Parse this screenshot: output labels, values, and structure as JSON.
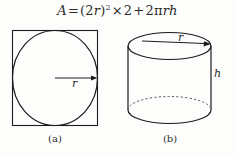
{
  "figure": {
    "formula": {
      "full_text": "A=(2r)²×2+2πrh",
      "lhs": "A",
      "equals": "=",
      "term1_open": "(2",
      "term1_var": "r",
      "term1_close": ")",
      "term1_exponent": "2",
      "times": "×",
      "factor": "2",
      "plus": "+",
      "term2_coefficient": "2π",
      "term2_var1": "r",
      "term2_var2": "h"
    },
    "panel_a": {
      "caption": "(a)",
      "shape_outer": "square",
      "shape_inner": "circle-inscribed",
      "radius_label": "r",
      "arrow": "radius-arrow-right"
    },
    "panel_b": {
      "caption": "(b)",
      "shape": "cylinder",
      "radius_label": "r",
      "height_label": "h",
      "arrow": "radius-arrow-right",
      "hidden_edge_style": "dashed"
    },
    "colors": {
      "background": "#fdfdfc",
      "ink": "#2a2a2a",
      "stroke": "#1c1c1c",
      "dashed_stroke": "#555555"
    }
  }
}
